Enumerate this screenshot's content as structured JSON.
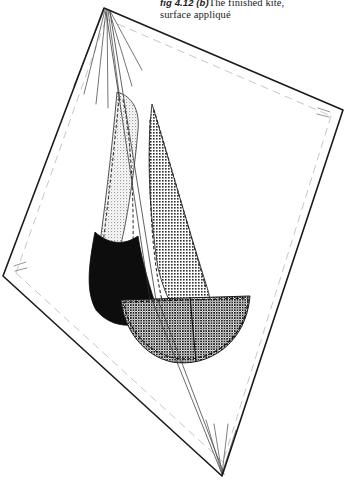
{
  "figure": {
    "caption_fignum": "fig 4.12 (b)",
    "caption_line1_text": "The finished kite,",
    "caption_line2_text": "surface appliqué",
    "ink_color": "#1a1a1a",
    "paper_color": "#ffffff",
    "black_sail_color": "#0d0d0d",
    "hull_tone_color": "#5a5a5a",
    "right_sail_tone_color": "#7d7d7d",
    "left_sail_tone_color": "#c9c9c9",
    "hem_line_color": "#b9b9b9"
  },
  "kite": {
    "name": "diamond-kite-outline",
    "apex_top": {
      "x": 104,
      "y": 8
    },
    "corner_left": {
      "x": 3,
      "y": 276
    },
    "corner_right": {
      "x": 343,
      "y": 110
    },
    "apex_bottom": {
      "x": 222,
      "y": 476
    },
    "spar_label": "cross-spar",
    "spine_label": "spine",
    "bridle_label": "bridle-lines"
  },
  "applique": {
    "parts": [
      {
        "name": "left-sail",
        "shape": "curved-triangle",
        "fill": "light-stipple"
      },
      {
        "name": "right-sail",
        "shape": "curved-triangle",
        "fill": "dense-checker"
      },
      {
        "name": "lower-left-sail",
        "shape": "curved-wedge",
        "fill": "solid-black"
      },
      {
        "name": "boat-hull",
        "shape": "half-disc",
        "fill": "dark-crosshatch"
      },
      {
        "name": "mast",
        "shape": "thin-double-line",
        "fill": "none"
      }
    ]
  }
}
